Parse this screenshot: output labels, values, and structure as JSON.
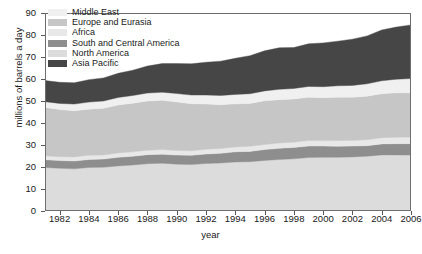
{
  "chart_data": {
    "type": "area",
    "stacked": true,
    "title": "",
    "xlabel": "year",
    "ylabel": "millions of barrels a day",
    "xlim": [
      1981,
      2006
    ],
    "ylim": [
      0,
      90
    ],
    "yticks": [
      0,
      10,
      20,
      30,
      40,
      50,
      60,
      70,
      80,
      90
    ],
    "xticks": [
      1982,
      1984,
      1986,
      1988,
      1990,
      1992,
      1994,
      1996,
      1998,
      2000,
      2002,
      2004,
      2006
    ],
    "grid": false,
    "legend_position": "top-left",
    "x": [
      1981,
      1982,
      1983,
      1984,
      1985,
      1986,
      1987,
      1988,
      1989,
      1990,
      1991,
      1992,
      1993,
      1994,
      1995,
      1996,
      1997,
      1998,
      1999,
      2000,
      2001,
      2002,
      2003,
      2004,
      2005,
      2006
    ],
    "stack_order_bottom_to_top": [
      "North America",
      "South and Central America",
      "Africa",
      "Europe and Eurasia",
      "Middle East",
      "Asia Pacific"
    ],
    "series": [
      {
        "name": "North America",
        "color": "#dcdcdc",
        "values": [
          19.8,
          19.4,
          19.2,
          19.8,
          19.9,
          20.5,
          20.9,
          21.5,
          21.7,
          21.3,
          21.1,
          21.6,
          21.8,
          22.3,
          22.4,
          23.0,
          23.4,
          23.7,
          24.3,
          24.4,
          24.4,
          24.6,
          24.9,
          25.5,
          25.5,
          25.4
        ]
      },
      {
        "name": "South and Central America",
        "color": "#8e8e8e",
        "values": [
          3.5,
          3.5,
          3.5,
          3.6,
          3.7,
          3.9,
          4.0,
          4.1,
          4.1,
          4.1,
          4.2,
          4.3,
          4.4,
          4.6,
          4.7,
          4.9,
          5.1,
          5.2,
          5.2,
          5.1,
          5.0,
          4.9,
          4.8,
          5.0,
          5.1,
          5.2
        ]
      },
      {
        "name": "Africa",
        "color": "#e8e8e8",
        "values": [
          1.8,
          1.8,
          1.9,
          1.9,
          1.9,
          2.0,
          2.0,
          2.0,
          2.1,
          2.1,
          2.1,
          2.2,
          2.2,
          2.2,
          2.3,
          2.3,
          2.4,
          2.4,
          2.5,
          2.5,
          2.6,
          2.6,
          2.7,
          2.8,
          2.9,
          3.0
        ]
      },
      {
        "name": "Europe and Eurasia",
        "color": "#c6c6c6",
        "values": [
          22.0,
          21.4,
          21.0,
          21.0,
          21.2,
          21.8,
          22.1,
          22.4,
          22.4,
          22.1,
          21.4,
          20.5,
          19.9,
          19.6,
          19.5,
          19.9,
          19.7,
          19.6,
          19.7,
          19.5,
          19.7,
          19.6,
          19.8,
          20.0,
          20.2,
          20.1
        ]
      },
      {
        "name": "Middle East",
        "color": "#f0f0f0",
        "values": [
          2.6,
          2.8,
          3.0,
          3.2,
          3.3,
          3.4,
          3.5,
          3.6,
          3.7,
          3.8,
          3.9,
          4.1,
          4.2,
          4.3,
          4.4,
          4.5,
          4.7,
          4.8,
          4.9,
          5.0,
          5.2,
          5.4,
          5.6,
          5.9,
          6.2,
          6.5
        ]
      },
      {
        "name": "Asia Pacific",
        "color": "#464646",
        "values": [
          9.6,
          9.6,
          9.7,
          10.2,
          10.5,
          11.0,
          11.5,
          12.3,
          13.0,
          13.6,
          14.2,
          14.9,
          15.6,
          16.4,
          17.3,
          18.2,
          18.9,
          18.6,
          19.4,
          19.9,
          20.3,
          21.0,
          21.8,
          23.1,
          23.7,
          24.4
        ]
      }
    ],
    "totals": [
      59.3,
      58.5,
      58.3,
      59.7,
      60.5,
      62.6,
      64.0,
      65.9,
      67.0,
      67.0,
      66.9,
      67.6,
      68.1,
      69.4,
      70.6,
      72.8,
      74.2,
      74.3,
      76.0,
      76.4,
      77.2,
      78.1,
      79.6,
      82.3,
      83.6,
      84.6
    ]
  },
  "legend": {
    "items": [
      {
        "label": "Middle East",
        "color": "#f0f0f0"
      },
      {
        "label": "Europe and Eurasia",
        "color": "#c6c6c6"
      },
      {
        "label": "Africa",
        "color": "#e8e8e8"
      },
      {
        "label": "South and Central America",
        "color": "#8e8e8e"
      },
      {
        "label": "North America",
        "color": "#dcdcdc"
      },
      {
        "label": "Asia Pacific",
        "color": "#464646"
      }
    ]
  },
  "axes": {
    "y_title": "millions of barrels a day",
    "x_title": "year",
    "y_tick_labels": [
      "90",
      "80",
      "70",
      "60",
      "50",
      "40",
      "30",
      "20",
      "10",
      "0"
    ],
    "x_tick_labels": [
      "1982",
      "1984",
      "1986",
      "1988",
      "1990",
      "1992",
      "1994",
      "1996",
      "1998",
      "2000",
      "2002",
      "2004",
      "2006"
    ]
  },
  "caption": ""
}
